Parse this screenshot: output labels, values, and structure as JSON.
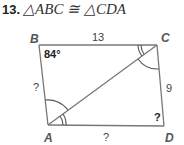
{
  "problem": {
    "number": "13.",
    "statement": "△ABC ≅ △CDA"
  },
  "figure": {
    "shape": "quadrilateral with diagonal AC",
    "vertices": {
      "A": {
        "label": "A",
        "x": 48,
        "y": 125
      },
      "B": {
        "label": "B",
        "x": 39,
        "y": 45
      },
      "C": {
        "label": "C",
        "x": 157,
        "y": 45
      },
      "D": {
        "label": "D",
        "x": 164,
        "y": 126
      }
    },
    "side_labels": {
      "BC": "13",
      "CD": "9",
      "AB": "?",
      "AD": "?"
    },
    "angle_labels": {
      "B": "84°",
      "D": "?"
    },
    "angle_marks": {
      "BAC": "single arc",
      "ACD": "single arc",
      "BCA": "double arc",
      "CAD": "double arc"
    },
    "colors": {
      "line": "#777777",
      "text": "#333333"
    }
  }
}
